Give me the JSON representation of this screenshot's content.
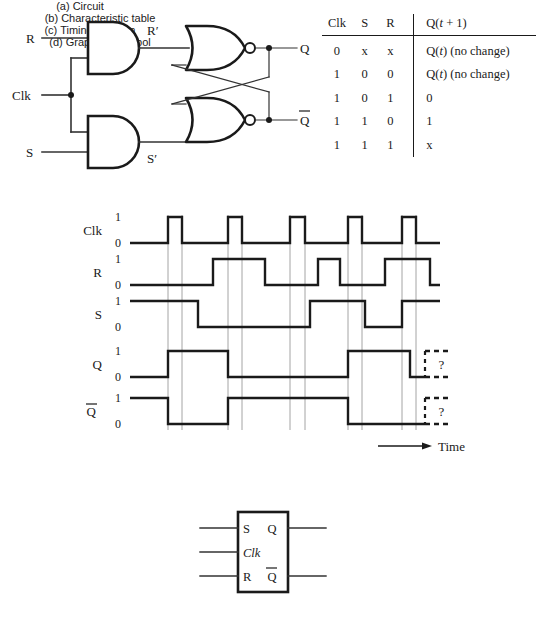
{
  "figure": {
    "parts": {
      "a": "(a) Circuit",
      "b": "(b) Characteristic table",
      "c": "(c) Timing diagram",
      "d": "(d) Graphical symbol"
    }
  },
  "circuit": {
    "inputs": [
      "R",
      "Clk",
      "S"
    ],
    "internal": [
      "R′",
      "S′"
    ],
    "outputs": [
      "Q",
      "Q"
    ],
    "output_bar_label": "Q",
    "gates": [
      "and-gate-r",
      "and-gate-s",
      "nor-gate-top",
      "nor-gate-bottom"
    ]
  },
  "table": {
    "headers": [
      "Clk",
      "S",
      "R",
      "Q(t + 1)"
    ],
    "header_q_prefix": "Q(",
    "header_q_italic": "t",
    "header_q_suffix": " + 1)",
    "rows": [
      {
        "clk": "0",
        "s": "x",
        "r": "x",
        "q": "Q(t) (no change)",
        "q_pre": "Q(",
        "q_ital": "t",
        "q_post": ") (no change)"
      },
      {
        "clk": "1",
        "s": "0",
        "r": "0",
        "q": "Q(t) (no change)",
        "q_pre": "Q(",
        "q_ital": "t",
        "q_post": ") (no change)"
      },
      {
        "clk": "1",
        "s": "0",
        "r": "1",
        "q": "0",
        "q_pre": "0",
        "q_ital": "",
        "q_post": ""
      },
      {
        "clk": "1",
        "s": "1",
        "r": "0",
        "q": "1",
        "q_pre": "1",
        "q_ital": "",
        "q_post": ""
      },
      {
        "clk": "1",
        "s": "1",
        "r": "1",
        "q": "x",
        "q_pre": "x",
        "q_ital": "",
        "q_post": ""
      }
    ]
  },
  "timing": {
    "axis_label": "Time",
    "level_high": "1",
    "level_low": "0",
    "unknown_marker": "?",
    "signals": [
      {
        "name": "Clk",
        "bar": false
      },
      {
        "name": "R",
        "bar": false
      },
      {
        "name": "S",
        "bar": false
      },
      {
        "name": "Q",
        "bar": false
      },
      {
        "name": "Q",
        "bar": true
      }
    ],
    "chart_note": "waveform transitions in pixel x-coordinates of the SVG"
  },
  "chart_data": {
    "type": "line",
    "title": "(c) Timing diagram",
    "xlabel": "Time",
    "ylabel": "",
    "x": [
      130,
      168,
      182,
      198,
      213,
      228,
      242,
      265,
      290,
      305,
      318,
      332,
      348,
      365,
      385,
      402,
      410,
      425,
      440
    ],
    "xlim": [
      130,
      440
    ],
    "ylim": [
      0,
      1
    ],
    "grid": true,
    "gridlines_x": [
      168,
      182,
      228,
      242,
      290,
      305,
      348,
      362,
      402,
      416
    ],
    "legend": "none",
    "series": [
      {
        "name": "Clk",
        "type": "digital",
        "initial": 0,
        "transitions": [
          [
            168,
            1
          ],
          [
            182,
            0
          ],
          [
            228,
            1
          ],
          [
            242,
            0
          ],
          [
            290,
            1
          ],
          [
            305,
            0
          ],
          [
            348,
            1
          ],
          [
            362,
            0
          ],
          [
            402,
            1
          ],
          [
            416,
            0
          ]
        ]
      },
      {
        "name": "R",
        "type": "digital",
        "initial": 0,
        "transitions": [
          [
            213,
            1
          ],
          [
            265,
            0
          ],
          [
            318,
            1
          ],
          [
            340,
            0
          ],
          [
            385,
            1
          ],
          [
            430,
            0
          ]
        ]
      },
      {
        "name": "S",
        "type": "digital",
        "initial": 1,
        "transitions": [
          [
            198,
            0
          ],
          [
            310,
            1
          ],
          [
            365,
            0
          ],
          [
            402,
            1
          ]
        ]
      },
      {
        "name": "Q",
        "type": "digital",
        "initial": 0,
        "transitions": [
          [
            168,
            1
          ],
          [
            228,
            0
          ],
          [
            348,
            1
          ],
          [
            410,
            0
          ]
        ],
        "unknown_after": 425
      },
      {
        "name": "Qbar",
        "type": "digital",
        "initial": 1,
        "transitions": [
          [
            168,
            0
          ],
          [
            228,
            1
          ],
          [
            348,
            0
          ]
        ],
        "unknown_after": 425
      }
    ]
  },
  "symbol": {
    "inputs": [
      {
        "label": "S",
        "italic": false
      },
      {
        "label": "Clk",
        "italic": true
      },
      {
        "label": "R",
        "italic": false
      }
    ],
    "outputs": [
      {
        "label": "Q",
        "bar": false
      },
      {
        "label": "Q",
        "bar": true
      }
    ]
  },
  "colors": {
    "ink": "#1a1a1a",
    "wire": "#333333",
    "gridline": "#9a9a9a",
    "background": "#ffffff"
  }
}
